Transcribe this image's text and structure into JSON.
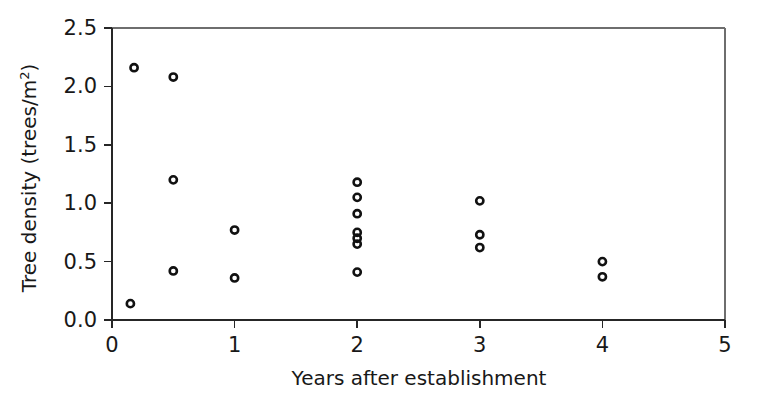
{
  "chart_data": {
    "type": "scatter",
    "title": "",
    "xlabel": "Years after establishment",
    "ylabel": "Tree density (trees/m²)",
    "ylabel_base": "Tree density (trees/m",
    "ylabel_sup": "2",
    "ylabel_tail": ")",
    "xlim": [
      0,
      5
    ],
    "ylim": [
      0.0,
      2.5
    ],
    "xticks": [
      0,
      1,
      2,
      3,
      4,
      5
    ],
    "xticklabels": [
      "0",
      "1",
      "2",
      "3",
      "4",
      "5"
    ],
    "yticks": [
      0.0,
      0.5,
      1.0,
      1.5,
      2.0,
      2.5
    ],
    "yticklabels": [
      "0.0",
      "0.5",
      "1.0",
      "1.5",
      "2.0",
      "2.5"
    ],
    "grid": false,
    "legend": null,
    "marker": "open-circle",
    "marker_color": "#111111",
    "points": [
      {
        "x": 0.15,
        "y": 0.14
      },
      {
        "x": 0.18,
        "y": 2.16
      },
      {
        "x": 0.5,
        "y": 2.08
      },
      {
        "x": 0.5,
        "y": 1.2
      },
      {
        "x": 0.5,
        "y": 0.42
      },
      {
        "x": 1.0,
        "y": 0.77
      },
      {
        "x": 1.0,
        "y": 0.36
      },
      {
        "x": 2.0,
        "y": 1.18
      },
      {
        "x": 2.0,
        "y": 1.05
      },
      {
        "x": 2.0,
        "y": 0.91
      },
      {
        "x": 2.0,
        "y": 0.75
      },
      {
        "x": 2.0,
        "y": 0.7
      },
      {
        "x": 2.0,
        "y": 0.65
      },
      {
        "x": 2.0,
        "y": 0.41
      },
      {
        "x": 3.0,
        "y": 1.02
      },
      {
        "x": 3.0,
        "y": 0.73
      },
      {
        "x": 3.0,
        "y": 0.62
      },
      {
        "x": 4.0,
        "y": 0.5
      },
      {
        "x": 4.0,
        "y": 0.37
      }
    ]
  },
  "figure": {
    "background_color": "#ffffff",
    "axis_color": "#262626",
    "text_color": "#181818"
  }
}
